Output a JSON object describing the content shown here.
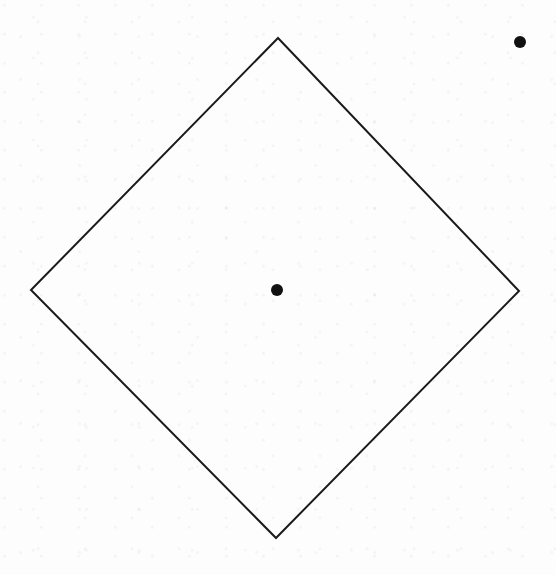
{
  "canvas": {
    "width": 556,
    "height": 575,
    "background": "#ffffff"
  },
  "diagram": {
    "shape": "diamond",
    "stroke": "#1a1a1a",
    "stroke_width": 2,
    "vertices": {
      "top": [
        278,
        38
      ],
      "right": [
        519,
        291
      ],
      "bottom": [
        276,
        538
      ],
      "left": [
        31,
        290
      ]
    },
    "points": [
      {
        "name": "center-point",
        "x": 277,
        "y": 290,
        "r": 6,
        "color": "#111111"
      },
      {
        "name": "outside-point",
        "x": 520,
        "y": 42,
        "r": 6,
        "color": "#111111"
      }
    ]
  }
}
